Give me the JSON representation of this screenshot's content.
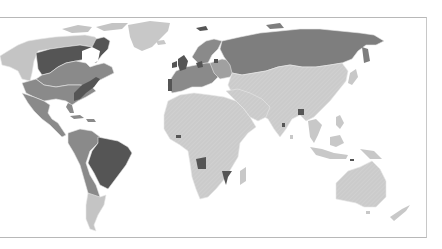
{
  "map": {
    "type": "choropleth-world",
    "title": "",
    "legend": [],
    "colors": {
      "background": "#ffffff",
      "frame": "#b8b8b8",
      "dark": "#555555",
      "medium": "#8a8a8a",
      "light": "#c6c6c6",
      "lightest": "#d2d2d2",
      "border": "#e6e6e6"
    },
    "categories": {
      "dark": [
        "Canada (Quebec/Ontario region)",
        "Eastern United States coast",
        "United Kingdom",
        "Ireland",
        "Portugal",
        "Netherlands/Belgium",
        "Brazil",
        "Angola",
        "Mozambique",
        "Bangladesh",
        "Guinea-Bissau/West Africa coast",
        "Hong Kong/Macau",
        "Timor"
      ],
      "medium": [
        "United States",
        "Mexico",
        "Central America",
        "Caribbean",
        "Colombia",
        "Venezuela",
        "Peru",
        "Bolivia",
        "Chile",
        "Paraguay",
        "Spain",
        "France",
        "Italy",
        "Germany",
        "Central Europe",
        "Scandinavia",
        "Russia",
        "Eastern Canada (Maritimes)"
      ],
      "light": [
        "Alaska",
        "Northern Canada",
        "Greenland",
        "Argentina",
        "Uruguay",
        "Africa",
        "Middle East",
        "Central Asia",
        "China",
        "India",
        "Southeast Asia",
        "Indonesia",
        "Philippines",
        "Japan",
        "Australia",
        "New Zealand",
        "Madagascar"
      ]
    }
  }
}
